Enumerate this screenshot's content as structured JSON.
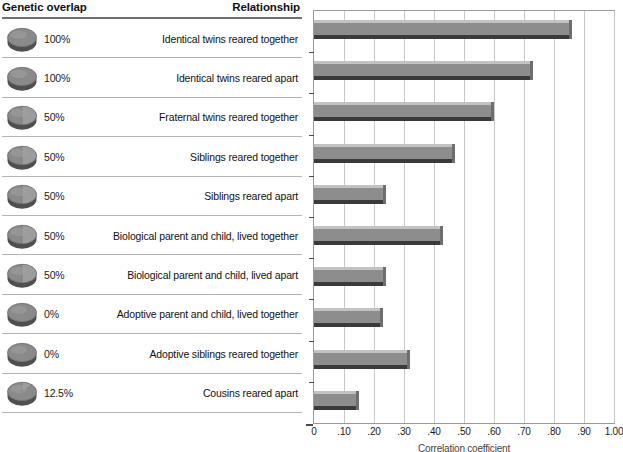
{
  "table": {
    "headers": {
      "genetic_overlap": "Genetic overlap",
      "relationship": "Relationship"
    },
    "rows": [
      {
        "percent": "100%",
        "fraction": 1.0,
        "relationship": "Identical twins reared together"
      },
      {
        "percent": "100%",
        "fraction": 1.0,
        "relationship": "Identical twins reared apart"
      },
      {
        "percent": "50%",
        "fraction": 0.5,
        "relationship": "Fraternal twins reared together"
      },
      {
        "percent": "50%",
        "fraction": 0.5,
        "relationship": "Siblings reared together"
      },
      {
        "percent": "50%",
        "fraction": 0.5,
        "relationship": "Siblings reared apart"
      },
      {
        "percent": "50%",
        "fraction": 0.5,
        "relationship": "Biological parent and child, lived together"
      },
      {
        "percent": "50%",
        "fraction": 0.5,
        "relationship": "Biological parent and child, lived apart"
      },
      {
        "percent": "0%",
        "fraction": 0.0,
        "relationship": "Adoptive parent and child, lived together"
      },
      {
        "percent": "0%",
        "fraction": 0.0,
        "relationship": "Adoptive siblings reared together"
      },
      {
        "percent": "12.5%",
        "fraction": 0.125,
        "relationship": "Cousins reared apart"
      }
    ]
  },
  "chart_data": {
    "type": "bar",
    "orientation": "horizontal",
    "title": "",
    "xlabel": "Correlation coefficient",
    "ylabel": "",
    "xlim": [
      0,
      1.0
    ],
    "grid": true,
    "legend": false,
    "tick_labels": [
      "0",
      ".10",
      ".20",
      ".30",
      ".40",
      ".50",
      ".60",
      ".70",
      ".80",
      ".90",
      "1.00"
    ],
    "tick_values": [
      0,
      0.1,
      0.2,
      0.3,
      0.4,
      0.5,
      0.6,
      0.7,
      0.8,
      0.9,
      1.0
    ],
    "categories": [
      "Identical twins reared together",
      "Identical twins reared apart",
      "Fraternal twins reared together",
      "Siblings reared together",
      "Siblings reared apart",
      "Biological parent and child, lived together",
      "Biological parent and child, lived apart",
      "Adoptive parent and child, lived together",
      "Adoptive siblings reared together",
      "Cousins reared apart"
    ],
    "values": [
      0.86,
      0.73,
      0.6,
      0.47,
      0.24,
      0.43,
      0.24,
      0.23,
      0.32,
      0.15
    ]
  },
  "colors": {
    "bar_body": "#8d8d8d",
    "bar_top": "#c2c2c2",
    "bar_shadow": "#3a3a3a",
    "gridline": "#c9c9c9",
    "plot_border": "#9a9a9a",
    "row_separator": "#b4b4b4",
    "header_rule": "#6f6f6f",
    "disc_fill": "#8a8a8a",
    "text": "#1a1a1a"
  },
  "icons": {
    "disc": "pie-disc-icon"
  }
}
